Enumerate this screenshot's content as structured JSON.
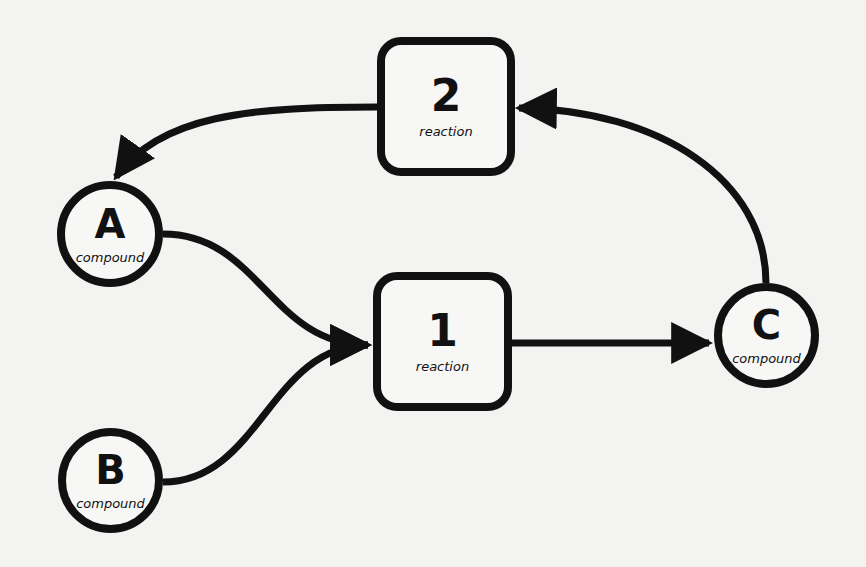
{
  "diagram": {
    "background": "#f3f3f1",
    "stroke_color": "#111111",
    "nodes": {
      "A": {
        "label": "A",
        "type_label": "compound"
      },
      "B": {
        "label": "B",
        "type_label": "compound"
      },
      "C": {
        "label": "C",
        "type_label": "compound"
      },
      "r1": {
        "label": "1",
        "type_label": "reaction"
      },
      "r2": {
        "label": "2",
        "type_label": "reaction"
      }
    },
    "edges": [
      {
        "from": "A",
        "to": "1"
      },
      {
        "from": "B",
        "to": "1"
      },
      {
        "from": "1",
        "to": "C"
      },
      {
        "from": "C",
        "to": "2"
      },
      {
        "from": "2",
        "to": "A"
      }
    ]
  }
}
